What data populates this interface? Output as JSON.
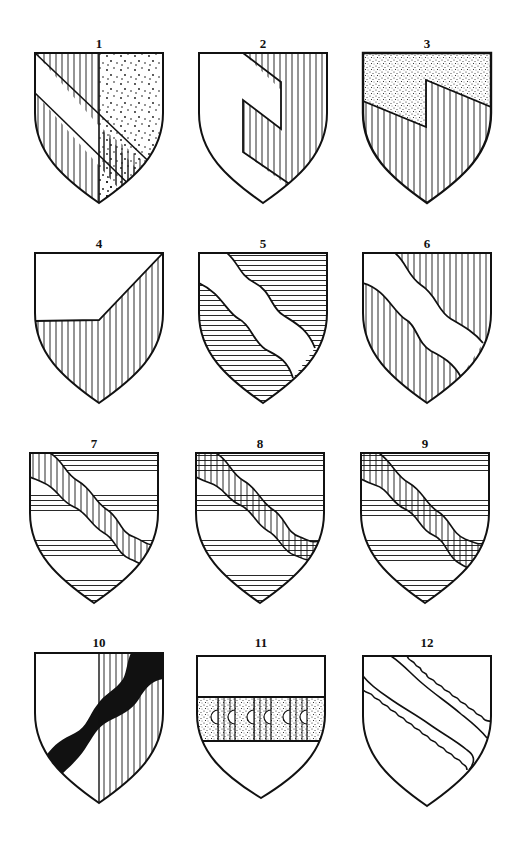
{
  "figure": {
    "ink_color": "#111111",
    "background": "#ffffff",
    "tinctures": {
      "white": "plain (argent)",
      "vertical_hatching": "gules (red)",
      "horizontal_hatching": "azure (blue)",
      "dots": "or (gold)",
      "black": "sable"
    }
  },
  "shields": [
    {
      "number": "1",
      "label": "1",
      "design": "per pale, bend sinister counterchanged: vertical hatch and dotted fields, white bend"
    },
    {
      "number": "2",
      "label": "2",
      "design": "white field, vertical hatching pattern with stepped/indented white bend"
    },
    {
      "number": "3",
      "label": "3",
      "design": "per bend sinister embattled (one step): dotted chief, vertical hatch base"
    },
    {
      "number": "4",
      "label": "4",
      "design": "per chevron-like angled division: white chief, vertical hatch base rising to dexter chief"
    },
    {
      "number": "5",
      "label": "5",
      "design": "horizontal hatch field, white bend wavy"
    },
    {
      "number": "6",
      "label": "6",
      "design": "vertical hatch field, white bend wavy"
    },
    {
      "number": "7",
      "label": "7",
      "design": "barry of horizontal hatch and white, bend wavy vertical hatch"
    },
    {
      "number": "8",
      "label": "8",
      "design": "barry of horizontal hatch and white, bend wavy vertical hatch"
    },
    {
      "number": "9",
      "label": "9",
      "design": "barry of horizontal hatch and white, bend wavy vertical hatch"
    },
    {
      "number": "10",
      "label": "10",
      "design": "per pale white and vertical hatch, bend sinister wavy black"
    },
    {
      "number": "11",
      "label": "11",
      "design": "white field, fess of alternating dotted and vertical hatch panels with semicircle notches"
    },
    {
      "number": "12",
      "label": "12",
      "design": "white field, bend with scrolled/floriated edges"
    }
  ]
}
